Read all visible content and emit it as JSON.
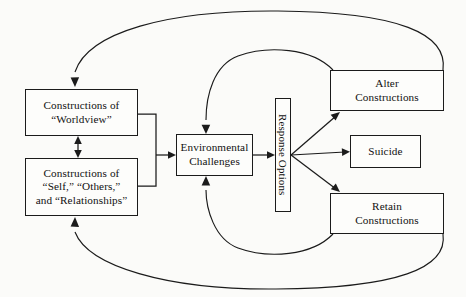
{
  "diagram": {
    "background_color": "#fbfbf9",
    "line_color": "#1b1b1b",
    "nodes": [
      {
        "id": "worldview",
        "label": "Constructions of\n“Worldview”"
      },
      {
        "id": "self",
        "label": "Constructions of\n“Self,”  “Others,”\nand “Relationships”"
      },
      {
        "id": "environmental_challenges",
        "label": "Environmental\nChallenges"
      },
      {
        "id": "response_options",
        "label": "Response Options",
        "orientation": "vertical-rotated-90"
      },
      {
        "id": "alter_constructions",
        "label": "Alter\nConstructions"
      },
      {
        "id": "suicide",
        "label": "Suicide"
      },
      {
        "id": "retain_constructions",
        "label": "Retain\nConstructions"
      }
    ],
    "edges": [
      {
        "from": "worldview",
        "to": "self",
        "type": "double-arrow-vertical"
      },
      {
        "from": "worldview+self",
        "to": "environmental_challenges",
        "type": "bracket-merge-arrow"
      },
      {
        "from": "environmental_challenges",
        "to": "response_options",
        "type": "arrow"
      },
      {
        "from": "response_options",
        "to": "alter_constructions",
        "type": "arrow-diagonal-up"
      },
      {
        "from": "response_options",
        "to": "suicide",
        "type": "arrow-horizontal"
      },
      {
        "from": "response_options",
        "to": "retain_constructions",
        "type": "arrow-diagonal-down"
      },
      {
        "from": "alter_constructions",
        "to": "worldview",
        "type": "feedback-curve-outer-top"
      },
      {
        "from": "alter_constructions",
        "to": "environmental_challenges",
        "type": "feedback-curve-inner-top"
      },
      {
        "from": "retain_constructions",
        "to": "self",
        "type": "feedback-curve-outer-bottom"
      },
      {
        "from": "retain_constructions",
        "to": "environmental_challenges",
        "type": "feedback-curve-inner-bottom"
      }
    ]
  }
}
